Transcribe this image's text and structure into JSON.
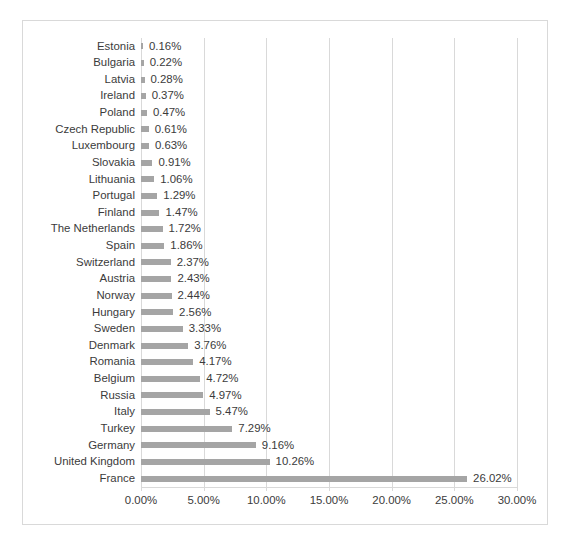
{
  "chart_data": {
    "type": "bar",
    "orientation": "horizontal",
    "title": "",
    "subtitle": "",
    "xlabel": "",
    "ylabel": "",
    "xlim": [
      0,
      30
    ],
    "grid": true,
    "legend": false,
    "value_suffix": "%",
    "bar_color": "#a5a5a5",
    "gridline_color": "#d9d9d9",
    "text_color": "#3b3b3b",
    "xticks": [
      0,
      5,
      10,
      15,
      20,
      25,
      30
    ],
    "xtick_labels": [
      "0.00%",
      "5.00%",
      "10.00%",
      "15.00%",
      "20.00%",
      "25.00%",
      "30.00%"
    ],
    "categories": [
      "Estonia",
      "Bulgaria",
      "Latvia",
      "Ireland",
      "Poland",
      "Czech Republic",
      "Luxembourg",
      "Slovakia",
      "Lithuania",
      "Portugal",
      "Finland",
      "The Netherlands",
      "Spain",
      "Switzerland",
      "Austria",
      "Norway",
      "Hungary",
      "Sweden",
      "Denmark",
      "Romania",
      "Belgium",
      "Russia",
      "Italy",
      "Turkey",
      "Germany",
      "United Kingdom",
      "France"
    ],
    "values": [
      0.16,
      0.22,
      0.28,
      0.37,
      0.47,
      0.61,
      0.63,
      0.91,
      1.06,
      1.29,
      1.47,
      1.72,
      1.86,
      2.37,
      2.43,
      2.44,
      2.56,
      3.33,
      3.76,
      4.17,
      4.72,
      4.97,
      5.47,
      7.29,
      9.16,
      10.26,
      26.02
    ],
    "data_labels": [
      "0.16%",
      "0.22%",
      "0.28%",
      "0.37%",
      "0.47%",
      "0.61%",
      "0.63%",
      "0.91%",
      "1.06%",
      "1.29%",
      "1.47%",
      "1.72%",
      "1.86%",
      "2.37%",
      "2.43%",
      "2.44%",
      "2.56%",
      "3.33%",
      "3.76%",
      "4.17%",
      "4.72%",
      "4.97%",
      "5.47%",
      "7.29%",
      "9.16%",
      "10.26%",
      "26.02%"
    ]
  }
}
